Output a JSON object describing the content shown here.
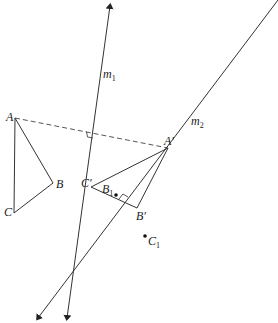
{
  "diagram": {
    "lines": [
      {
        "id": "m1",
        "label": "m",
        "sub": "1"
      },
      {
        "id": "m2",
        "label": "m",
        "sub": "2"
      }
    ],
    "points": {
      "A": {
        "label": "A"
      },
      "B": {
        "label": "B"
      },
      "C": {
        "label": "C"
      },
      "A_prime": {
        "label": "A′"
      },
      "B_prime": {
        "label": "B′"
      },
      "C_prime": {
        "label": "C′"
      },
      "B1": {
        "label": "B",
        "sub": "1"
      },
      "C1": {
        "label": "C",
        "sub": "1"
      }
    },
    "labels": {
      "m1": "m",
      "m1_sub": "1",
      "m2": "m",
      "m2_sub": "2",
      "A": "A",
      "B": "B",
      "C": "C",
      "A_prime": "A′",
      "B_prime": "B′",
      "C_prime": "C′",
      "B1": "B",
      "B1_sub": "1",
      "C1": "C",
      "C1_sub": "1"
    },
    "colors": {
      "stroke": "#333333",
      "background": "#ffffff"
    }
  }
}
